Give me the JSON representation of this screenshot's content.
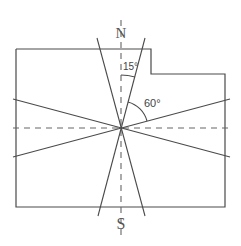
{
  "diagram": {
    "type": "orientation-sector-diagram",
    "labels": {
      "north": "N",
      "south": "S",
      "angle_small": "15°",
      "angle_large": "60°"
    },
    "colors": {
      "line": "#4a4a4a",
      "dashed": "#666666",
      "background": "#ffffff"
    },
    "angles": {
      "narrow_sector_half_angle_deg": 15,
      "wide_sector_angle_from_north_deg": 60
    }
  }
}
